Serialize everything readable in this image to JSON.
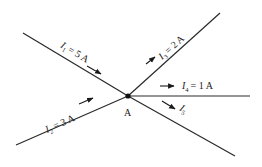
{
  "diagram": {
    "type": "kirchhoff-junction",
    "junction": {
      "label": "A",
      "x": 128,
      "y": 96
    },
    "branches": [
      {
        "id": "I1",
        "symbol": "I",
        "subscript": "1",
        "value": "= 5 A",
        "direction": "into-junction",
        "x1": 23,
        "y1": 33,
        "x2": 128,
        "y2": 96
      },
      {
        "id": "I2",
        "symbol": "I",
        "subscript": "2",
        "value": "= 3 A",
        "direction": "into-junction",
        "x1": 16,
        "y1": 145,
        "x2": 128,
        "y2": 96
      },
      {
        "id": "I3",
        "symbol": "I",
        "subscript": "3",
        "value": "= 2 A",
        "direction": "out-of-junction",
        "x1": 128,
        "y1": 96,
        "x2": 220,
        "y2": 13
      },
      {
        "id": "I4",
        "symbol": "I",
        "subscript": "4",
        "value": "= 1 A",
        "direction": "out-of-junction",
        "x1": 128,
        "y1": 96,
        "x2": 250,
        "y2": 96
      },
      {
        "id": "I5",
        "symbol": "I",
        "subscript": "5",
        "value": "",
        "direction": "out-of-junction",
        "x1": 128,
        "y1": 96,
        "x2": 235,
        "y2": 156
      }
    ]
  }
}
